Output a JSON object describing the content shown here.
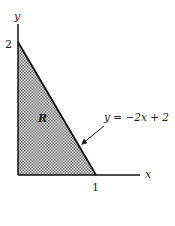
{
  "diagram": {
    "type": "region-plot",
    "axes": {
      "x_label": "x",
      "y_label": "y",
      "x_tick": "1",
      "y_tick": "2"
    },
    "region": {
      "label": "R",
      "vertices": [
        [
          0,
          0
        ],
        [
          1,
          0
        ],
        [
          0,
          2
        ]
      ],
      "fill": "checker-gray"
    },
    "curve": {
      "equation": "y = −2x + 2"
    },
    "colors": {
      "line": "#111111",
      "fill_dark": "#7a7a7a",
      "fill_light": "#d8d8d8",
      "background": "#ffffff"
    }
  }
}
